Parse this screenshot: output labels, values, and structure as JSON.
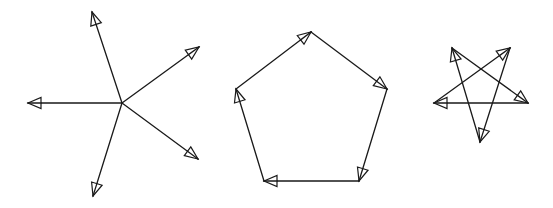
{
  "diagram": {
    "colors": {
      "stroke": "#1a1a1a",
      "background": "#ffffff",
      "arrowhead_fill": "#ffffff"
    },
    "figures": [
      {
        "name": "radiating-vectors",
        "center": [
          122,
          103
        ],
        "arrows": [
          {
            "from": [
              122,
              103
            ],
            "to": [
              92,
              12
            ]
          },
          {
            "from": [
              122,
              103
            ],
            "to": [
              199,
              47
            ]
          },
          {
            "from": [
              122,
              103
            ],
            "to": [
              198,
              159
            ]
          },
          {
            "from": [
              122,
              103
            ],
            "to": [
              93,
              196
            ]
          },
          {
            "from": [
              122,
              103
            ],
            "to": [
              28,
              103
            ]
          }
        ]
      },
      {
        "name": "pentagon-vector-sum",
        "arrows": [
          {
            "from": [
              236,
              89
            ],
            "to": [
              311,
              32
            ]
          },
          {
            "from": [
              311,
              32
            ],
            "to": [
              387,
              89
            ]
          },
          {
            "from": [
              387,
              89
            ],
            "to": [
              359,
              181
            ]
          },
          {
            "from": [
              359,
              181
            ],
            "to": [
              264,
              181
            ]
          },
          {
            "from": [
              264,
              181
            ],
            "to": [
              236,
              89
            ]
          }
        ]
      },
      {
        "name": "pentagram-vector-sum",
        "arrows": [
          {
            "from": [
              434,
              103
            ],
            "to": [
              510,
              48
            ]
          },
          {
            "from": [
              510,
              48
            ],
            "to": [
              480,
              142
            ]
          },
          {
            "from": [
              480,
              142
            ],
            "to": [
              452,
              48
            ]
          },
          {
            "from": [
              452,
              48
            ],
            "to": [
              528,
              103
            ]
          },
          {
            "from": [
              528,
              103
            ],
            "to": [
              434,
              103
            ]
          }
        ]
      }
    ]
  }
}
